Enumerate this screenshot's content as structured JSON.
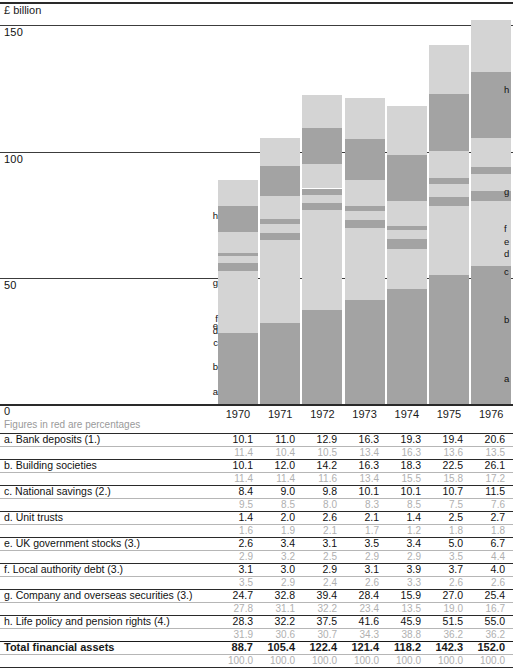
{
  "chart_data": {
    "type": "bar",
    "stacked": true,
    "title": "",
    "unit_label": "£ billion",
    "ylabel": "£ billion",
    "xlabel": "",
    "ylim": [
      0,
      160
    ],
    "yticks": [
      0,
      50,
      100,
      150
    ],
    "ytick_labels": [
      "0",
      "50",
      "100",
      "150"
    ],
    "grid": false,
    "categories": [
      "1970",
      "1971",
      "1972",
      "1973",
      "1974",
      "1975",
      "1976"
    ],
    "series": [
      {
        "key": "a",
        "name": "Bank deposits (1.)",
        "values": [
          10.1,
          11.0,
          12.9,
          16.3,
          19.3,
          19.4,
          20.6
        ],
        "percentages": [
          11.4,
          10.4,
          10.5,
          13.4,
          16.3,
          13.6,
          13.5
        ],
        "shade": "light"
      },
      {
        "key": "b",
        "name": "Building societies",
        "values": [
          10.1,
          12.0,
          14.2,
          16.3,
          18.3,
          22.5,
          26.1
        ],
        "percentages": [
          11.4,
          11.4,
          11.6,
          13.4,
          15.5,
          15.8,
          17.2
        ],
        "shade": "dark"
      },
      {
        "key": "c",
        "name": "National savings (2.)",
        "values": [
          8.4,
          9.0,
          9.8,
          10.1,
          10.1,
          10.7,
          11.5
        ],
        "percentages": [
          9.5,
          8.5,
          8.0,
          8.3,
          8.5,
          7.5,
          7.6
        ],
        "shade": "light"
      },
      {
        "key": "d",
        "name": "Unit trusts",
        "values": [
          1.4,
          2.0,
          2.6,
          2.1,
          1.4,
          2.5,
          2.7
        ],
        "percentages": [
          1.6,
          1.9,
          2.1,
          1.7,
          1.2,
          1.8,
          1.8
        ],
        "shade": "dark"
      },
      {
        "key": "e",
        "name": "UK government stocks (3.)",
        "values": [
          2.6,
          3.4,
          3.1,
          3.5,
          3.4,
          5.0,
          6.7
        ],
        "percentages": [
          2.9,
          3.2,
          2.5,
          2.9,
          2.9,
          3.5,
          4.4
        ],
        "shade": "light"
      },
      {
        "key": "f",
        "name": "Local authority debt (3.)",
        "values": [
          3.1,
          3.0,
          2.9,
          3.1,
          3.9,
          3.7,
          4.0
        ],
        "percentages": [
          3.5,
          2.9,
          2.4,
          2.6,
          3.3,
          2.6,
          2.6
        ],
        "shade": "dark"
      },
      {
        "key": "g",
        "name": "Company and overseas securities (3.)",
        "values": [
          24.7,
          32.8,
          39.4,
          28.4,
          15.9,
          27.0,
          25.4
        ],
        "percentages": [
          27.8,
          31.1,
          32.2,
          23.4,
          13.5,
          19.0,
          16.7
        ],
        "shade": "light"
      },
      {
        "key": "h",
        "name": "Life policy and pension rights (4.)",
        "values": [
          28.3,
          32.2,
          37.5,
          41.6,
          45.9,
          51.5,
          55.0
        ],
        "percentages": [
          31.9,
          30.6,
          30.7,
          34.3,
          38.8,
          36.2,
          36.2
        ],
        "shade": "dark"
      }
    ],
    "total": {
      "label": "Total financial assets",
      "values": [
        88.7,
        105.4,
        122.4,
        121.4,
        118.2,
        142.3,
        152.0
      ],
      "percentages": [
        100.0,
        100.0,
        100.0,
        100.0,
        100.0,
        100.0,
        100.0
      ]
    },
    "segment_keys": [
      "a",
      "b",
      "c",
      "d",
      "e",
      "f",
      "g",
      "h"
    ],
    "note": "Figures in red are percentages",
    "colors": {
      "light": "#d4d4d4",
      "dark": "#a3a3a3",
      "axis": "#2a2a2a",
      "percentage_text": "#b0b0b0"
    }
  },
  "table": {
    "year_headers": [
      "1970",
      "1971",
      "1972",
      "1973",
      "1974",
      "1975",
      "1976"
    ],
    "note": "Figures in red are percentages",
    "rows": [
      {
        "label": "a. Bank deposits (1.)",
        "values": [
          "10.1",
          "11.0",
          "12.9",
          "16.3",
          "19.3",
          "19.4",
          "20.6"
        ],
        "percentages": [
          "11.4",
          "10.4",
          "10.5",
          "13.4",
          "16.3",
          "13.6",
          "13.5"
        ]
      },
      {
        "label": "b. Building societies",
        "values": [
          "10.1",
          "12.0",
          "14.2",
          "16.3",
          "18.3",
          "22.5",
          "26.1"
        ],
        "percentages": [
          "11.4",
          "11.4",
          "11.6",
          "13.4",
          "15.5",
          "15.8",
          "17.2"
        ]
      },
      {
        "label": "c. National savings (2.)",
        "values": [
          "8.4",
          "9.0",
          "9.8",
          "10.1",
          "10.1",
          "10.7",
          "11.5"
        ],
        "percentages": [
          "9.5",
          "8.5",
          "8.0",
          "8.3",
          "8.5",
          "7.5",
          "7.6"
        ]
      },
      {
        "label": "d. Unit trusts",
        "values": [
          "1.4",
          "2.0",
          "2.6",
          "2.1",
          "1.4",
          "2.5",
          "2.7"
        ],
        "percentages": [
          "1.6",
          "1.9",
          "2.1",
          "1.7",
          "1.2",
          "1.8",
          "1.8"
        ]
      },
      {
        "label": "e. UK government stocks (3.)",
        "values": [
          "2.6",
          "3.4",
          "3.1",
          "3.5",
          "3.4",
          "5.0",
          "6.7"
        ],
        "percentages": [
          "2.9",
          "3.2",
          "2.5",
          "2.9",
          "2.9",
          "3.5",
          "4.4"
        ]
      },
      {
        "label": "f.  Local authority debt (3.)",
        "values": [
          "3.1",
          "3.0",
          "2.9",
          "3.1",
          "3.9",
          "3.7",
          "4.0"
        ],
        "percentages": [
          "3.5",
          "2.9",
          "2.4",
          "2.6",
          "3.3",
          "2.6",
          "2.6"
        ]
      },
      {
        "label": "g. Company and overseas securities (3.)",
        "values": [
          "24.7",
          "32.8",
          "39.4",
          "28.4",
          "15.9",
          "27.0",
          "25.4"
        ],
        "percentages": [
          "27.8",
          "31.1",
          "32.2",
          "23.4",
          "13.5",
          "19.0",
          "16.7"
        ]
      },
      {
        "label": "h. Life policy and pension rights (4.)",
        "values": [
          "28.3",
          "32.2",
          "37.5",
          "41.6",
          "45.9",
          "51.5",
          "55.0"
        ],
        "percentages": [
          "31.9",
          "30.6",
          "30.7",
          "34.3",
          "38.8",
          "36.2",
          "36.2"
        ]
      }
    ],
    "total_row": {
      "label": "Total financial assets",
      "values": [
        "88.7",
        "105.4",
        "122.4",
        "121.4",
        "118.2",
        "142.3",
        "152.0"
      ],
      "percentages": [
        "100.0",
        "100.0",
        "100.0",
        "100.0",
        "100.0",
        "100.0",
        "100.0"
      ]
    }
  }
}
